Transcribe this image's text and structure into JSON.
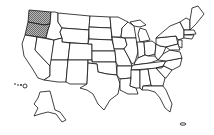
{
  "map": {
    "title": "United States map",
    "highlight_color": "#9a9a9a",
    "outline_color": "#111111",
    "background": "#ffffff",
    "highlighted_states": [
      "Washington",
      "Oregon"
    ],
    "states": [
      {
        "id": "WA",
        "name": "Washington",
        "highlighted": true
      },
      {
        "id": "OR",
        "name": "Oregon",
        "highlighted": true
      },
      {
        "id": "CA",
        "name": "California",
        "highlighted": false
      },
      {
        "id": "ID",
        "name": "Idaho",
        "highlighted": false
      },
      {
        "id": "NV",
        "name": "Nevada",
        "highlighted": false
      },
      {
        "id": "MT",
        "name": "Montana",
        "highlighted": false
      },
      {
        "id": "WY",
        "name": "Wyoming",
        "highlighted": false
      },
      {
        "id": "UT",
        "name": "Utah",
        "highlighted": false
      },
      {
        "id": "AZ",
        "name": "Arizona",
        "highlighted": false
      },
      {
        "id": "CO",
        "name": "Colorado",
        "highlighted": false
      },
      {
        "id": "NM",
        "name": "New Mexico",
        "highlighted": false
      },
      {
        "id": "ND",
        "name": "North Dakota",
        "highlighted": false
      },
      {
        "id": "SD",
        "name": "South Dakota",
        "highlighted": false
      },
      {
        "id": "NE",
        "name": "Nebraska",
        "highlighted": false
      },
      {
        "id": "KS",
        "name": "Kansas",
        "highlighted": false
      },
      {
        "id": "OK",
        "name": "Oklahoma",
        "highlighted": false
      },
      {
        "id": "TX",
        "name": "Texas",
        "highlighted": false
      },
      {
        "id": "MN",
        "name": "Minnesota",
        "highlighted": false
      },
      {
        "id": "IA",
        "name": "Iowa",
        "highlighted": false
      },
      {
        "id": "MO",
        "name": "Missouri",
        "highlighted": false
      },
      {
        "id": "AR",
        "name": "Arkansas",
        "highlighted": false
      },
      {
        "id": "LA",
        "name": "Louisiana",
        "highlighted": false
      },
      {
        "id": "WI",
        "name": "Wisconsin",
        "highlighted": false
      },
      {
        "id": "IL",
        "name": "Illinois",
        "highlighted": false
      },
      {
        "id": "MI",
        "name": "Michigan",
        "highlighted": false
      },
      {
        "id": "IN",
        "name": "Indiana",
        "highlighted": false
      },
      {
        "id": "OH",
        "name": "Ohio",
        "highlighted": false
      },
      {
        "id": "KY",
        "name": "Kentucky",
        "highlighted": false
      },
      {
        "id": "TN",
        "name": "Tennessee",
        "highlighted": false
      },
      {
        "id": "MS",
        "name": "Mississippi",
        "highlighted": false
      },
      {
        "id": "AL",
        "name": "Alabama",
        "highlighted": false
      },
      {
        "id": "GA",
        "name": "Georgia",
        "highlighted": false
      },
      {
        "id": "FL",
        "name": "Florida",
        "highlighted": false
      },
      {
        "id": "SC",
        "name": "South Carolina",
        "highlighted": false
      },
      {
        "id": "NC",
        "name": "North Carolina",
        "highlighted": false
      },
      {
        "id": "VA",
        "name": "Virginia",
        "highlighted": false
      },
      {
        "id": "WV",
        "name": "West Virginia",
        "highlighted": false
      },
      {
        "id": "PA",
        "name": "Pennsylvania",
        "highlighted": false
      },
      {
        "id": "NY",
        "name": "New York",
        "highlighted": false
      },
      {
        "id": "NE-states",
        "name": "New England",
        "highlighted": false
      },
      {
        "id": "AK",
        "name": "Alaska",
        "highlighted": false
      },
      {
        "id": "HI",
        "name": "Hawaii",
        "highlighted": false
      }
    ]
  }
}
